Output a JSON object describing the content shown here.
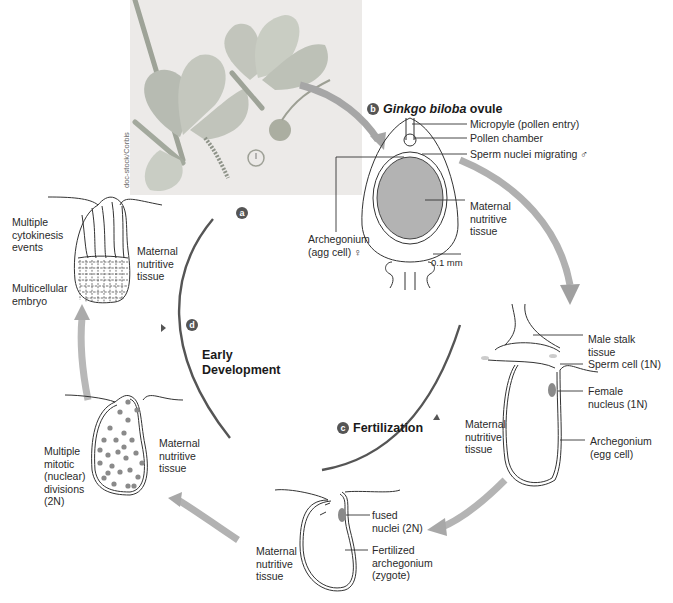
{
  "figure": {
    "credit": "doc-stock/Corbis",
    "colors": {
      "cycle_arc": "#555555",
      "transition_arrow": "#a9a9a9",
      "tissue_fill": "#b3b3b3",
      "nucleus_fill": "#8a8a8a",
      "photo_bg": "#eceae8",
      "badge": "#555555"
    }
  },
  "stages": {
    "a": {
      "badge": "a"
    },
    "b": {
      "badge": "b",
      "title_italic": "Ginkgo biloba",
      "title_rest": " ovule"
    },
    "c": {
      "badge": "c",
      "title": "Fertilization"
    },
    "d": {
      "badge": "d",
      "title": "Early\nDevelopment"
    }
  },
  "ovule_labels": {
    "micropyle": "Micropyle (pollen entry)",
    "pollen_chamber": "Pollen chamber",
    "sperm_nuclei": "Sperm nuclei migrating ♂",
    "maternal_tissue": "Maternal\nnutritive\ntissue",
    "archegonium": "Archegonium\n(agg cell)  ♀",
    "scale_bar": "0.1 mm"
  },
  "fertilization_labels": {
    "male_stalk": "Male stalk\ntissue",
    "sperm_cell": "Sperm cell (1N)",
    "female_nucleus": "Female\nnucleus (1N)",
    "maternal_tissue": "Maternal\nnutritive\ntissue",
    "archegonium": "Archegonium\n(egg cell)"
  },
  "zygote_labels": {
    "fused_nuclei": "fused\nnuclei (2N)",
    "fertilized": "Fertilized\narchegonium\n(zygote)",
    "maternal_tissue": "Maternal\nnutritive\ntissue"
  },
  "mitotic_labels": {
    "divisions": "Multiple\nmitotic\n(nuclear)\ndivisions\n(2N)",
    "maternal_tissue": "Maternal\nnutritive\ntissue"
  },
  "embryo_labels": {
    "cytokinesis": "Multiple\ncytokinesis\nevents",
    "multicellular": "Multicellular\nembryo",
    "maternal_tissue": "Maternal\nnutritive\ntissue"
  }
}
